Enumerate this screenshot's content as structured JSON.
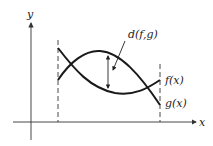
{
  "diagram": {
    "axes": {
      "x_label": "x",
      "y_label": "y"
    },
    "curves": [
      {
        "name": "f",
        "label": "f(x)"
      },
      {
        "name": "g",
        "label": "g(x)"
      }
    ],
    "distance_label": "d(f,g)",
    "colors": {
      "stroke": "#1a1a1a",
      "axis": "#333333",
      "background": "#ffffff"
    }
  }
}
